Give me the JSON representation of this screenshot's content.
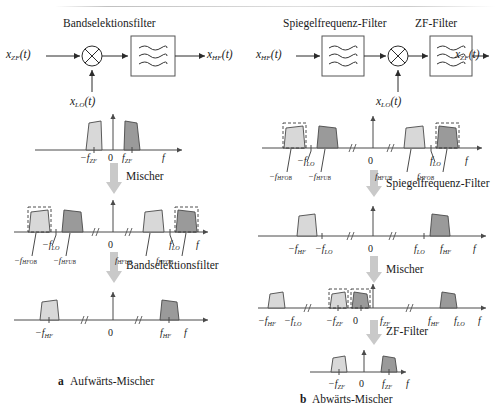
{
  "figure": {
    "caption_a_marker": "a",
    "caption_a": "Aufwärts-Mischer",
    "caption_b_marker": "b",
    "caption_b": "Abwärts-Mischer"
  },
  "colors": {
    "spectrum_light": "#d8d8d8",
    "spectrum_dark": "#9a9a9a",
    "arrow_gray": "#c9c9c9",
    "line": "#2b2b2b"
  },
  "left": {
    "block_diagram": {
      "filter_title": "Bandselektionsfilter",
      "input_label": "x",
      "input_sub": "ZF",
      "input_suffix": "(t)",
      "lo_label": "x",
      "lo_sub": "LO",
      "lo_suffix": "(t)",
      "output_label": "x",
      "output_sub": "HF",
      "output_suffix": "(t)",
      "mixer_icon": "multiply-circle-icon",
      "filter_icon": "lowpass-filter-icon"
    },
    "steps": [
      {
        "label": "Mischer"
      },
      {
        "label": "Bandselektionsfilter"
      }
    ],
    "spectra": [
      {
        "name": "zf-spectrum",
        "axis_label": "f",
        "zero_label": "0",
        "ticks": [
          {
            "text": "−f",
            "sub": "ZF"
          },
          {
            "text": "f",
            "sub": "ZF"
          }
        ]
      },
      {
        "name": "mixed-spectrum",
        "axis_label": "f",
        "zero_label": "0",
        "ticks": [
          {
            "text": "−f",
            "sub": "LO"
          },
          {
            "text": "f",
            "sub": "LO"
          },
          {
            "text": "−f",
            "sub": "HFOB"
          },
          {
            "text": "−f",
            "sub": "HFUB"
          },
          {
            "text": "f",
            "sub": "HFUB"
          },
          {
            "text": "f",
            "sub": "HFOB"
          }
        ]
      },
      {
        "name": "hf-spectrum",
        "axis_label": "f",
        "zero_label": "0",
        "ticks": [
          {
            "text": "−f",
            "sub": "HF"
          },
          {
            "text": "f",
            "sub": "HF"
          }
        ]
      }
    ]
  },
  "right": {
    "block_diagram": {
      "filter1_title": "Spiegelfrequenz-Filter",
      "filter2_title": "ZF-Filter",
      "input_label": "x",
      "input_sub": "HF",
      "input_suffix": "(t)",
      "lo_label": "x",
      "lo_sub": "LO",
      "lo_suffix": "(t)",
      "output_label": "x",
      "output_sub": "ZF",
      "output_suffix": "(t)",
      "mixer_icon": "multiply-circle-icon",
      "filter_icon": "lowpass-filter-icon"
    },
    "steps": [
      {
        "label": "Spiegelfrequenz-Filter"
      },
      {
        "label": "Mischer"
      },
      {
        "label": "ZF-Filter"
      }
    ],
    "spectra": [
      {
        "name": "hf-input-spectrum",
        "axis_label": "f",
        "zero_label": "0",
        "ticks": [
          {
            "text": "−f",
            "sub": "LO"
          },
          {
            "text": "f",
            "sub": "LO"
          },
          {
            "text": "−f",
            "sub": "HFOB"
          },
          {
            "text": "−f",
            "sub": "HFUB"
          },
          {
            "text": "f",
            "sub": "HFUB"
          },
          {
            "text": "f",
            "sub": "HFOB"
          }
        ]
      },
      {
        "name": "filtered-spectrum",
        "axis_label": "f",
        "zero_label": "0",
        "ticks": [
          {
            "text": "−f",
            "sub": "HF"
          },
          {
            "text": "−f",
            "sub": "LO"
          },
          {
            "text": "f",
            "sub": "LO"
          },
          {
            "text": "f",
            "sub": "HF"
          }
        ]
      },
      {
        "name": "downmixed-spectrum",
        "axis_label": "f",
        "zero_label": "0",
        "ticks": [
          {
            "text": "−f",
            "sub": "HF"
          },
          {
            "text": "−f",
            "sub": "LO"
          },
          {
            "text": "−f",
            "sub": "ZF"
          },
          {
            "text": "f",
            "sub": "ZF"
          },
          {
            "text": "f",
            "sub": "HF"
          },
          {
            "text": "f",
            "sub": "LO"
          }
        ]
      },
      {
        "name": "zf-output-spectrum",
        "axis_label": "f",
        "zero_label": "0",
        "ticks": [
          {
            "text": "−f",
            "sub": "ZF"
          },
          {
            "text": "f",
            "sub": "ZF"
          }
        ]
      }
    ]
  }
}
